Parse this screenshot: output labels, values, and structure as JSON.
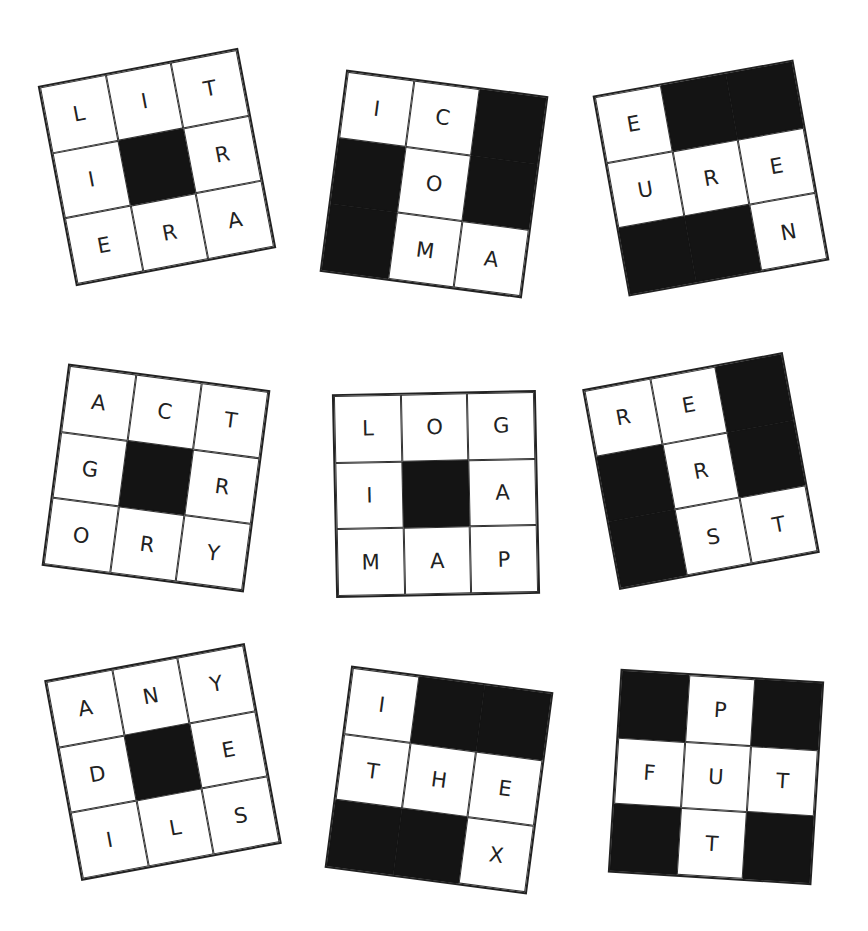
{
  "colors": {
    "background": "#ffffff",
    "block": "#141414",
    "line": "#222222",
    "letter": "#222222"
  },
  "grids": [
    {
      "id": "grid-1",
      "position": "top-left",
      "rotation_deg": -10.8,
      "center": [
        157,
        167
      ],
      "cells": [
        "L",
        "I",
        "T",
        "I",
        "#",
        "R",
        "E",
        "R",
        "A"
      ]
    },
    {
      "id": "grid-2",
      "position": "top-center",
      "rotation_deg": 7.5,
      "center": [
        434,
        184
      ],
      "cells": [
        "I",
        "C",
        "#",
        "#",
        "O",
        "#",
        "#",
        "M",
        "A"
      ]
    },
    {
      "id": "grid-3",
      "position": "top-right",
      "rotation_deg": -10.2,
      "center": [
        711,
        178
      ],
      "cells": [
        "E",
        "#",
        "#",
        "U",
        "R",
        "E",
        "#",
        "#",
        "N"
      ]
    },
    {
      "id": "grid-4",
      "position": "middle-left",
      "rotation_deg": 7.5,
      "center": [
        156,
        478
      ],
      "cells": [
        "A",
        "C",
        "T",
        "G",
        "#",
        "R",
        "O",
        "R",
        "Y"
      ]
    },
    {
      "id": "grid-5",
      "position": "middle-center",
      "rotation_deg": -1.2,
      "center": [
        436,
        494
      ],
      "cells": [
        "L",
        "O",
        "G",
        "I",
        "#",
        "A",
        "M",
        "A",
        "P"
      ]
    },
    {
      "id": "grid-6",
      "position": "middle-right",
      "rotation_deg": -10.5,
      "center": [
        701,
        471
      ],
      "cells": [
        "R",
        "E",
        "#",
        "#",
        "R",
        "#",
        "#",
        "S",
        "T"
      ]
    },
    {
      "id": "grid-7",
      "position": "bottom-left",
      "rotation_deg": -10.5,
      "center": [
        163,
        762
      ],
      "cells": [
        "A",
        "N",
        "Y",
        "D",
        "#",
        "E",
        "I",
        "L",
        "S"
      ]
    },
    {
      "id": "grid-8",
      "position": "bottom-center",
      "rotation_deg": 7.5,
      "center": [
        439,
        780
      ],
      "cells": [
        "I",
        "#",
        "#",
        "T",
        "H",
        "E",
        "#",
        "#",
        "X"
      ]
    },
    {
      "id": "grid-9",
      "position": "bottom-right",
      "rotation_deg": 3.6,
      "center": [
        716,
        777
      ],
      "cells": [
        "#",
        "P",
        "#",
        "F",
        "U",
        "T",
        "#",
        "T",
        "#"
      ]
    }
  ]
}
